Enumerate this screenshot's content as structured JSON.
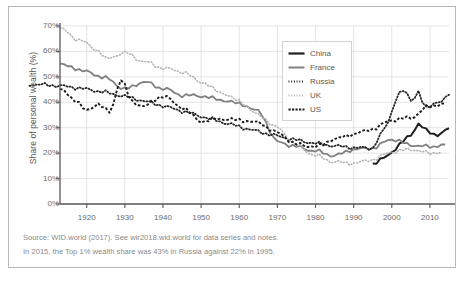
{
  "chart_data": {
    "type": "line",
    "title": "",
    "xlabel": "",
    "ylabel": "Share of personal wealth (%)",
    "xlim": [
      1913,
      2015
    ],
    "ylim": [
      0,
      70
    ],
    "grid": true,
    "legend_position": "top-right",
    "x_ticks": [
      1920,
      1930,
      1940,
      1950,
      1960,
      1970,
      1980,
      1990,
      2000,
      2010
    ],
    "x_tick_labels": [
      "1920",
      "1930",
      "1940",
      "1950",
      "1960",
      "1970",
      "1980",
      "1990",
      "2000",
      "2010"
    ],
    "y_ticks": [
      0,
      10,
      20,
      30,
      40,
      50,
      60,
      70
    ],
    "y_tick_labels": [
      "0%",
      "10%",
      "20%",
      "30%",
      "40%",
      "50%",
      "60%",
      "70%"
    ],
    "series": [
      {
        "name": "China",
        "color": "#1f1f1f",
        "style": "solid",
        "width": 2.0,
        "x": [
          1995,
          1996,
          1997,
          1998,
          1999,
          2000,
          2001,
          2002,
          2003,
          2004,
          2005,
          2006,
          2007,
          2008,
          2009,
          2010,
          2011,
          2012,
          2013,
          2014,
          2015
        ],
        "y": [
          15.8,
          16.4,
          17.2,
          18.1,
          19.2,
          20.5,
          21.9,
          23.2,
          24.6,
          26.0,
          27.3,
          29.4,
          31.6,
          30.2,
          28.9,
          28.2,
          27.6,
          27.3,
          27.8,
          28.6,
          29.8
        ]
      },
      {
        "name": "France",
        "color": "#808080",
        "style": "solid",
        "width": 1.8,
        "x": [
          1913,
          1915,
          1920,
          1925,
          1930,
          1935,
          1940,
          1945,
          1950,
          1955,
          1960,
          1965,
          1970,
          1975,
          1980,
          1985,
          1990,
          1995,
          2000,
          2005,
          2010,
          2014
        ],
        "y": [
          54.9,
          54.2,
          52.0,
          49.5,
          45.2,
          48.0,
          45.5,
          42.8,
          42.5,
          41.0,
          39.5,
          36.5,
          24.5,
          22.5,
          20.8,
          19.0,
          21.5,
          22.0,
          25.5,
          23.2,
          22.5,
          23.4
        ]
      },
      {
        "name": "Russia",
        "color": "#262626",
        "style": "dotted",
        "width": 1.8,
        "x": [
          1905,
          1995,
          1996,
          1997,
          1998,
          1999,
          2000,
          2001,
          2002,
          2003,
          2004,
          2005,
          2006,
          2007,
          2008,
          2009,
          2010,
          2011,
          2012,
          2013,
          2014,
          2015
        ],
        "y": [
          47.0,
          22.0,
          24.5,
          27.0,
          29.5,
          32.0,
          36.5,
          41.0,
          43.5,
          44.5,
          43.0,
          41.0,
          42.0,
          44.5,
          40.0,
          37.5,
          38.5,
          39.5,
          40.5,
          40.0,
          41.5,
          43.0
        ]
      },
      {
        "name": "UK",
        "color": "#b5b5b5",
        "style": "dotted",
        "width": 1.6,
        "x": [
          1913,
          1918,
          1923,
          1925,
          1930,
          1935,
          1940,
          1945,
          1950,
          1955,
          1960,
          1965,
          1970,
          1975,
          1980,
          1985,
          1990,
          1995,
          2000,
          2005,
          2010,
          2013
        ],
        "y": [
          69.0,
          64.5,
          60.5,
          57.0,
          59.5,
          56.0,
          53.5,
          52.0,
          48.0,
          44.0,
          40.5,
          35.0,
          30.0,
          23.0,
          19.0,
          16.5,
          16.0,
          17.5,
          20.5,
          21.5,
          20.0,
          20.5
        ]
      },
      {
        "name": "US",
        "color": "#1a1a1a",
        "style": "dashed",
        "width": 1.9,
        "x": [
          1913,
          1917,
          1920,
          1923,
          1926,
          1929,
          1932,
          1935,
          1940,
          1945,
          1950,
          1955,
          1960,
          1965,
          1970,
          1975,
          1980,
          1985,
          1990,
          1995,
          2000,
          2005,
          2010,
          2014
        ],
        "y": [
          45.0,
          41.0,
          36.5,
          39.5,
          36.0,
          49.0,
          40.0,
          38.5,
          42.5,
          38.0,
          32.5,
          33.5,
          33.0,
          32.0,
          28.0,
          23.5,
          22.5,
          25.5,
          27.5,
          29.5,
          33.0,
          34.0,
          38.5,
          39.5
        ]
      }
    ]
  },
  "legend": {
    "items": [
      {
        "label": "China",
        "swatch": "solid-dark"
      },
      {
        "label": "France",
        "swatch": "solid-gray"
      },
      {
        "label": "Russia",
        "swatch": "dotted-dark"
      },
      {
        "label": "UK",
        "swatch": "dotted-light"
      },
      {
        "label": "US",
        "swatch": "dashed-dark"
      }
    ]
  },
  "footnotes": {
    "source": "Source: WID.world (2017). See wir2018.wid.world for data series and notes.",
    "note": "In 2015, the Top 1% wealth share was 43% in Russia against 22% in 1995."
  },
  "colors": {
    "china": "#1f1f1f",
    "france": "#808080",
    "russia": "#262626",
    "uk": "#b5b5b5",
    "us": "#1a1a1a",
    "grid": "#d9d9d9",
    "axis": "#595959",
    "text": "#6b6b6b",
    "footnote": "#8a8a8a"
  }
}
